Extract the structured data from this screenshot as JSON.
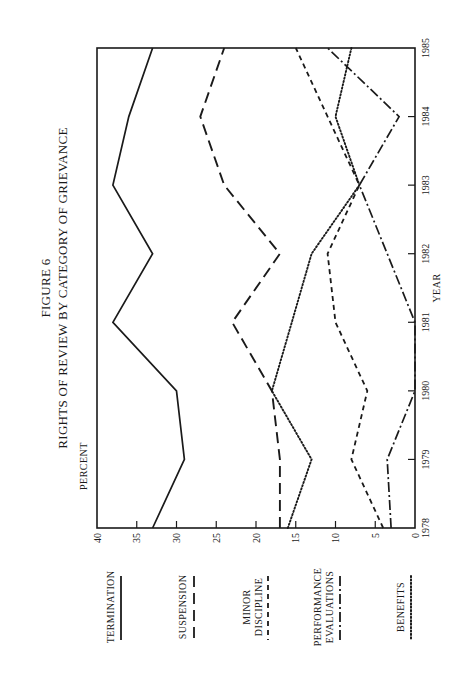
{
  "figure": {
    "number_label": "FIGURE 6",
    "title": "RIGHTS OF REVIEW BY CATEGORY OF GRIEVANCE",
    "orientation": "rotated-90-ccw",
    "ink_color": "#1a1a1a",
    "background": "#ffffff"
  },
  "axes": {
    "y_title": "PERCENT",
    "x_title": "YEAR",
    "y_ticks": [
      "40",
      "35",
      "30",
      "25",
      "20",
      "15",
      "10",
      "5",
      "0"
    ],
    "x_ticks": [
      "1978",
      "1979",
      "1980",
      "1981",
      "1982",
      "1983",
      "1984",
      "1985"
    ]
  },
  "legend": [
    {
      "label_lines": [
        "TERMINATION"
      ],
      "style": "solid"
    },
    {
      "label_lines": [
        "SUSPENSION"
      ],
      "style": "long-dash"
    },
    {
      "label_lines": [
        "MINOR",
        "DISCIPLINE"
      ],
      "style": "short-dash"
    },
    {
      "label_lines": [
        "PERFORMANCE",
        "EVALUATIONS"
      ],
      "style": "dash-dot"
    },
    {
      "label_lines": [
        "BENEFITS"
      ],
      "style": "dotted"
    }
  ],
  "chart_data": {
    "type": "line",
    "xlabel": "YEAR",
    "ylabel": "PERCENT",
    "x": [
      1978,
      1979,
      1980,
      1981,
      1982,
      1983,
      1984,
      1985
    ],
    "ylim": [
      0,
      40
    ],
    "yticks": [
      0,
      5,
      10,
      15,
      20,
      25,
      30,
      35,
      40
    ],
    "grid": false,
    "legend_position": "left (below when unrotated), separate from plot",
    "rotated": "90deg counter-clockwise on page",
    "series": [
      {
        "name": "TERMINATION",
        "style": "solid",
        "values": [
          33,
          29,
          30,
          38,
          33,
          38,
          36,
          33
        ]
      },
      {
        "name": "SUSPENSION",
        "style": "long-dash",
        "values": [
          17,
          17,
          18,
          23,
          17,
          24,
          27,
          24
        ]
      },
      {
        "name": "MINOR DISCIPLINE",
        "style": "short-dash",
        "values": [
          4,
          8,
          6,
          10,
          11,
          7,
          11,
          15
        ]
      },
      {
        "name": "PERFORMANCE EVALUATIONS",
        "style": "dash-dot",
        "values": [
          3,
          3.5,
          0,
          0,
          3.5,
          7,
          2,
          11
        ]
      },
      {
        "name": "BENEFITS",
        "style": "dotted",
        "values": [
          16,
          13,
          18,
          15.5,
          13,
          7,
          10,
          8
        ]
      }
    ]
  }
}
